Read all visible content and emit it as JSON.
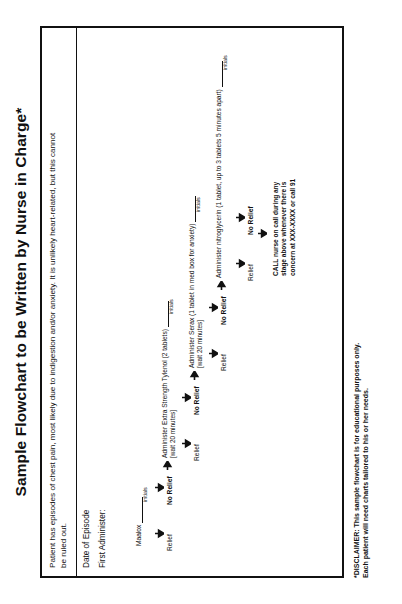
{
  "document": {
    "title": "Sample Flowchart to be Written by Nurse in Charge*",
    "intro": "Patient has episodes of chest pain, most likely due to indigestion and/or anxiety. It is unlikely heart-related, but this cannot be ruled out.",
    "fields": {
      "date_label": "Date of Episode",
      "first_administer_label": "First Administer:"
    },
    "disclaimer_line1": "*DISCLAIMER: This sample flowchart is for educational purposes only.",
    "disclaimer_line2": "Each patient will need charts tailored to his or her needs."
  },
  "flowchart": {
    "initials_label": "initials",
    "relief_label": "Relief",
    "no_relief_label": "No Relief",
    "steps": [
      {
        "name": "maalox",
        "med": "Maalox",
        "wait": "",
        "relief": "Relief",
        "no_relief": "No Relief"
      },
      {
        "name": "tylenol",
        "med": "Administer Extra Strength Tylenol (2 tablets)",
        "wait": "[wait 20 minutes]",
        "relief": "Relief",
        "no_relief": "No Relief"
      },
      {
        "name": "serax",
        "med": "Administer Serax (1 tablet in med box for anxiety)",
        "wait": "[wait 20 minutes]",
        "relief": "Relief",
        "no_relief": "No Relief"
      },
      {
        "name": "nitroglycerin",
        "med": "Administer nitroglycerin (1 tablet, up to 3 tablets 5 minutes apart)",
        "wait": "",
        "relief": "Relief",
        "no_relief": "No Relief"
      }
    ],
    "final_action": "CALL nurse on call during any stage above whenever there is concern at XXX-XXXX or call 91"
  },
  "colors": {
    "ink": "#111111",
    "page": "#ffffff"
  }
}
